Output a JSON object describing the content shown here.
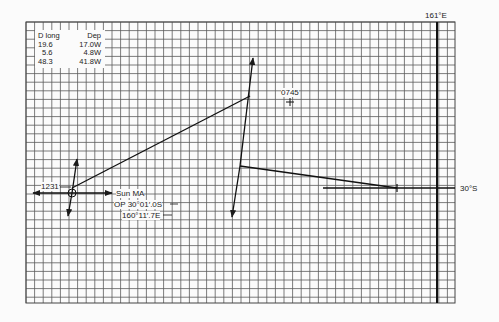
{
  "table": {
    "headers": [
      "D long",
      "Dep"
    ],
    "rows": [
      [
        "19.6",
        "17.0W"
      ],
      [
        "5.6",
        "4.8W"
      ],
      [
        "48.3",
        "41.8W"
      ]
    ]
  },
  "labels": {
    "meridian": "161°E",
    "parallel": "30°S",
    "fix_time": "1231",
    "dr_time": "0745",
    "sun_ma": "Sun MA",
    "op_lat": "OP 30°01′.0S",
    "op_long": "160°11′.7E"
  },
  "colors": {
    "grid": "#555555",
    "lines": "#1a1a1a",
    "background": "#fbfbfb"
  },
  "grid": {
    "left": 26,
    "top": 22,
    "right": 455,
    "bottom": 303,
    "cell": 8.6
  }
}
